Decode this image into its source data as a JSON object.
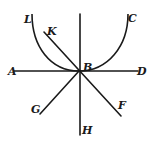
{
  "diagram": {
    "stroke_color": "#1a1a1a",
    "background": "#ffffff",
    "center_point": {
      "name": "B",
      "x": 79,
      "y": 71
    },
    "labels": [
      {
        "id": "L",
        "text": "L",
        "x": 24,
        "y": 14
      },
      {
        "id": "K",
        "text": "K",
        "x": 47,
        "y": 26
      },
      {
        "id": "C",
        "text": "C",
        "x": 128,
        "y": 13
      },
      {
        "id": "A",
        "text": "A",
        "x": 8,
        "y": 66
      },
      {
        "id": "B",
        "text": "B",
        "x": 83,
        "y": 62
      },
      {
        "id": "D",
        "text": "D",
        "x": 137,
        "y": 66
      },
      {
        "id": "G",
        "text": "G",
        "x": 31,
        "y": 104
      },
      {
        "id": "F",
        "text": "F",
        "x": 118,
        "y": 100
      },
      {
        "id": "H",
        "text": "H",
        "x": 82,
        "y": 125
      }
    ],
    "lines": [
      {
        "id": "AD",
        "from": "A",
        "to": "D",
        "x1": 14,
        "y1": 71,
        "x2": 138,
        "y2": 71
      },
      {
        "id": "vertical",
        "from": "top",
        "to": "H",
        "x1": 80,
        "y1": 14,
        "x2": 80,
        "y2": 135
      },
      {
        "id": "KF",
        "from": "K",
        "to": "F",
        "x1": 44,
        "y1": 32,
        "x2": 121,
        "y2": 116
      },
      {
        "id": "GB",
        "from": "G",
        "to": "B",
        "x1": 40,
        "y1": 114,
        "x2": 79,
        "y2": 71
      }
    ],
    "curves": [
      {
        "id": "LBC",
        "from": "L",
        "through": "B",
        "to": "C",
        "path": "M 32 14 C 32 46, 50 71, 79 71 C 108 71, 128 46, 128 14"
      }
    ]
  }
}
